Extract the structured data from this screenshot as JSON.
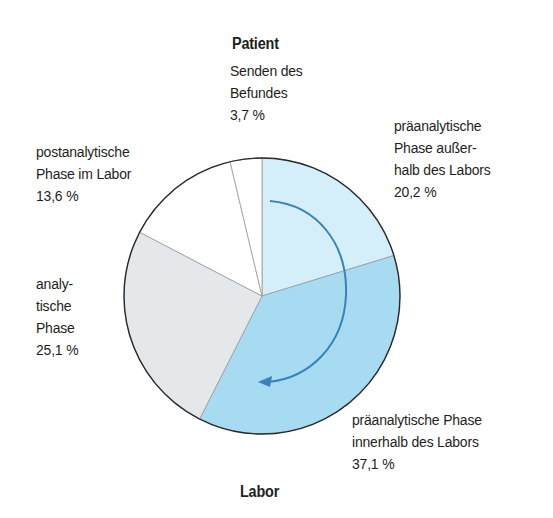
{
  "chart_data": {
    "type": "pie",
    "title": "",
    "start_angle_deg": 0,
    "direction": "clockwise",
    "top_label": "Patient",
    "bottom_label": "Labor",
    "slices": [
      {
        "label": "präanalytische Phase außerhalb des Labors",
        "value": 20.2,
        "display": "20,2 %",
        "color": "#d4eff9"
      },
      {
        "label": "präanalytische Phase innerhalb des Labors",
        "value": 37.1,
        "display": "37,1 %",
        "color": "#a6dbf2"
      },
      {
        "label": "analytische Phase",
        "value": 25.1,
        "display": "25,1 %",
        "color": "#e5e8eb"
      },
      {
        "label": "postanalytische Phase im Labor",
        "value": 13.6,
        "display": "13,6 %",
        "color": "#ffffff"
      },
      {
        "label": "Senden des Befundes",
        "value": 3.7,
        "display": "3,7 %",
        "color": "#ffffff"
      }
    ],
    "annotation": "curved arrow indicating clockwise direction through pre-analytical phases",
    "arrow_color": "#3a82bc"
  },
  "labels": {
    "patient": "Patient",
    "labor": "Labor",
    "senden": {
      "l1": "Senden des",
      "l2": "Befundes",
      "l3": "3,7 %"
    },
    "pre_out": {
      "l1": "präanalytische",
      "l2": "Phase außer-",
      "l3": "halb des Labors",
      "l4": "20,2 %"
    },
    "post": {
      "l1": "postanalytische",
      "l2": "Phase im  Labor",
      "l3": "13,6 %"
    },
    "analytic": {
      "l1": "analy-",
      "l2": "tische",
      "l3": "Phase",
      "l4": "25,1 %"
    },
    "pre_in": {
      "l1": "präanalytische Phase",
      "l2": "innerhalb des Labors",
      "l3": "37,1 %"
    }
  }
}
